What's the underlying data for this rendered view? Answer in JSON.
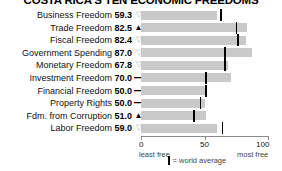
{
  "title": "COSTA RICA'S TEN ECONOMIC FREEDOMS",
  "axis": {
    "min_label": "0",
    "mid_label": "50",
    "max_label": "100",
    "least_free": "least free",
    "most_free": "most free"
  },
  "legend": {
    "symbol": "world-average-tick",
    "text": "= world average"
  },
  "colors": {
    "bar": "#c9c9c9",
    "average_tick": "#000000",
    "axis": "#8a8a8a",
    "down_arrow": "#b8b8b8",
    "up_arrow": "#000000",
    "background": "#ffffff"
  },
  "chart_data": {
    "type": "bar",
    "title": "COSTA RICA'S TEN ECONOMIC FREEDOMS",
    "xlabel": "",
    "ylabel": "",
    "xlim": [
      0,
      100
    ],
    "grid": false,
    "legend_position": "bottom",
    "orientation": "horizontal",
    "categories": [
      "Business Freedom",
      "Trade Freedom",
      "Fiscal Freedom",
      "Government Spending",
      "Monetary Freedom",
      "Investment Freedom",
      "Financial Freedom",
      "Property Rights",
      "Fdm. from Corruption",
      "Labor Freedom"
    ],
    "values": [
      59.3,
      82.5,
      82.4,
      87.0,
      67.8,
      70.0,
      50.0,
      50.0,
      51.0,
      59.0
    ],
    "world_average": [
      62,
      74,
      75,
      65,
      65,
      50,
      50,
      46,
      41,
      63
    ],
    "trends": [
      "down",
      "up",
      "down",
      "down",
      "down",
      "flat",
      "flat",
      "flat",
      "up",
      "down"
    ],
    "series": [
      {
        "name": "Costa Rica score",
        "values": [
          59.3,
          82.5,
          82.4,
          87.0,
          67.8,
          70.0,
          50.0,
          50.0,
          51.0,
          59.0
        ]
      },
      {
        "name": "world average",
        "values": [
          62,
          74,
          75,
          65,
          65,
          50,
          50,
          46,
          41,
          63
        ]
      }
    ]
  },
  "rows": [
    {
      "label": "Business Freedom",
      "value": "59.3",
      "trend": "down",
      "glyph": "▽",
      "score": 59.3,
      "avg": 62
    },
    {
      "label": "Trade Freedom",
      "value": "82.5",
      "trend": "up",
      "glyph": "▲",
      "score": 82.5,
      "avg": 74
    },
    {
      "label": "Fiscal Freedom",
      "value": "82.4",
      "trend": "down",
      "glyph": "▽",
      "score": 82.4,
      "avg": 75
    },
    {
      "label": "Government Spending",
      "value": "87.0",
      "trend": "down",
      "glyph": "▽",
      "score": 87.0,
      "avg": 65
    },
    {
      "label": "Monetary Freedom",
      "value": "67.8",
      "trend": "down",
      "glyph": "▽",
      "score": 67.8,
      "avg": 65
    },
    {
      "label": "Investment Freedom",
      "value": "70.0",
      "trend": "flat",
      "glyph": "—",
      "score": 70.0,
      "avg": 50
    },
    {
      "label": "Financial Freedom",
      "value": "50.0",
      "trend": "flat",
      "glyph": "—",
      "score": 50.0,
      "avg": 50
    },
    {
      "label": "Property Rights",
      "value": "50.0",
      "trend": "flat",
      "glyph": "—",
      "score": 50.0,
      "avg": 46
    },
    {
      "label": "Fdm. from Corruption",
      "value": "51.0",
      "trend": "up",
      "glyph": "▲",
      "score": 51.0,
      "avg": 41
    },
    {
      "label": "Labor Freedom",
      "value": "59.0",
      "trend": "down",
      "glyph": "▽",
      "score": 59.0,
      "avg": 63
    }
  ]
}
